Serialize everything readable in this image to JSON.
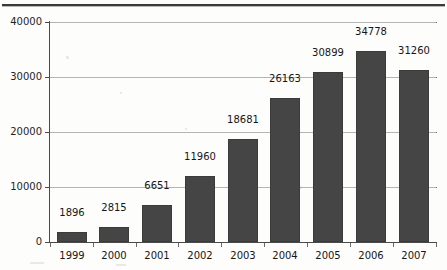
{
  "chart_data": {
    "type": "bar",
    "title": "",
    "subtitle": "",
    "xlabel": "",
    "ylabel": "",
    "categories": [
      "1999",
      "2000",
      "2001",
      "2002",
      "2003",
      "2004",
      "2005",
      "2006",
      "2007"
    ],
    "values": [
      1896,
      2815,
      6651,
      11960,
      18681,
      26163,
      30899,
      34778,
      31260
    ],
    "value_labels": [
      "1896",
      "2815",
      "6651",
      "11960",
      "18681",
      "26163",
      "30899",
      "34778",
      "31260"
    ],
    "series": [
      {
        "name": "",
        "values": [
          1896,
          2815,
          6651,
          11960,
          18681,
          26163,
          30899,
          34778,
          31260
        ]
      }
    ],
    "ylim": [
      0,
      40000
    ],
    "y_ticks": [
      0,
      10000,
      20000,
      30000,
      40000
    ],
    "y_tick_labels": [
      "0",
      "10000",
      "20000",
      "30000",
      "40000"
    ],
    "grid": true,
    "grid_axis": "y",
    "legend": false,
    "legend_position": "none",
    "data_labels": true,
    "bar_color": "#454545",
    "grid_color": "#b4b4b4",
    "axis_color": "#4a4a4a",
    "background_color": "#fdfdfc",
    "text_color": "#161616"
  }
}
